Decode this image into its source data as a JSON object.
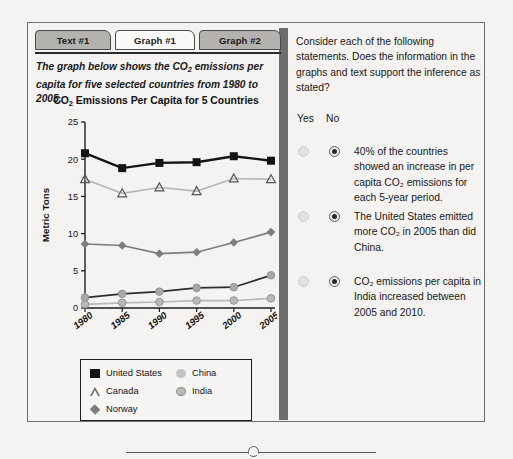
{
  "tabs": [
    {
      "label": "Text #1",
      "active": false
    },
    {
      "label": "Graph #1",
      "active": true
    },
    {
      "label": "Graph #2",
      "active": false
    }
  ],
  "left_panel": {
    "intro_line1": "The graph below shows the CO",
    "intro_sub1": "2",
    "intro_line1b": " emissions per",
    "intro_line2": "capita for five selected countries from 1980 to 2005.",
    "chart_title_a": "CO",
    "chart_title_sub": "2",
    "chart_title_b": " Emissions Per Capita for 5 Countries"
  },
  "legend": {
    "united_states": "United States",
    "canada": "Canada",
    "norway": "Norway",
    "china": "China",
    "india": "India"
  },
  "right_panel": {
    "prompt_line1": "Consider each of the following",
    "prompt_line2": "statements. Does the information",
    "prompt_line3": "in the graphs and text support",
    "prompt_line4": "the inference as stated?",
    "yes_label": "Yes",
    "no_label": "No",
    "statements": [
      {
        "text": "40% of the countries showed an increase in per capita CO₂ emissions for each 5-year period.",
        "yes_selected": false,
        "no_selected": true
      },
      {
        "text": "The United States emitted more CO₂ in 2005 than did China.",
        "yes_selected": false,
        "no_selected": true
      },
      {
        "text": "CO₂ emissions per capita in India increased between 2005 and 2010.",
        "yes_selected": false,
        "no_selected": true
      }
    ]
  },
  "colors": {
    "tab_inactive": "#b4b2ae",
    "tab_active": "#fbfaf8",
    "divider": "#6d6d6d",
    "frame": "#6f6f6f",
    "text": "#18181a",
    "united_states": "#141414",
    "canada": "#b6b6b6",
    "norway": "#7d7d7d",
    "china": "#2d2d2d",
    "india": "#b9b9b9"
  },
  "chart_data": {
    "type": "line",
    "title": "CO2 Emissions Per Capita for 5 Countries",
    "xlabel": "",
    "ylabel": "Metric Tons",
    "x": [
      "1980",
      "1985",
      "1990",
      "1995",
      "2000",
      "2005"
    ],
    "xtick_labels": [
      "1980",
      "1985",
      "1990",
      "1995",
      "2000",
      "2005"
    ],
    "ytick_labels": [
      "0",
      "5",
      "10",
      "15",
      "20",
      "25"
    ],
    "ylim": [
      0,
      25
    ],
    "grid": false,
    "legend_position": "below-plot",
    "series": [
      {
        "name": "United States",
        "marker": "filled-square",
        "color": "#141414",
        "line_color": "#141414",
        "values": [
          20.8,
          18.8,
          19.5,
          19.6,
          20.4,
          19.8
        ]
      },
      {
        "name": "Canada",
        "marker": "open-triangle",
        "color": "#ffffff",
        "line_color": "#b6b6b6",
        "values": [
          17.3,
          15.4,
          16.2,
          15.7,
          17.4,
          17.3
        ]
      },
      {
        "name": "Norway",
        "marker": "filled-diamond",
        "color": "#7d7d7d",
        "line_color": "#7d7d7d",
        "values": [
          8.6,
          8.4,
          7.3,
          7.5,
          8.8,
          10.2
        ]
      },
      {
        "name": "China",
        "marker": "filled-circle",
        "color": "#a8a8a8",
        "line_color": "#2d2d2d",
        "values": [
          1.4,
          1.9,
          2.2,
          2.7,
          2.8,
          4.4
        ]
      },
      {
        "name": "India",
        "marker": "filled-circle",
        "color": "#b9b9b9",
        "line_color": "#b9b9b9",
        "values": [
          0.5,
          0.7,
          0.8,
          1.0,
          1.0,
          1.3
        ]
      }
    ]
  }
}
